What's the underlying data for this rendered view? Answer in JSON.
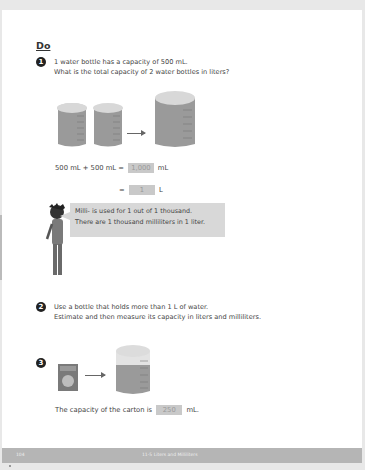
{
  "section_title": "Do",
  "questions": [
    {
      "number": "1",
      "lines": [
        "1 water bottle has a capacity of 500 mL.",
        "What is the total capacity of 2 water bottles in liters?"
      ],
      "equation1": {
        "left": "500 mL + 500 mL =",
        "answer": "1,000",
        "unit": "mL"
      },
      "equation2": {
        "left": "=",
        "answer": "1",
        "unit": "L"
      },
      "tip": [
        "Milli- is used for 1 out of 1 thousand.",
        "There are 1 thousand milliliters in 1 liter."
      ]
    },
    {
      "number": "2",
      "lines": [
        "Use a bottle that holds more than 1 L of water.",
        "Estimate and then measure its capacity in liters and milliliters."
      ]
    },
    {
      "number": "3",
      "sentence": {
        "left": "The capacity of the carton is",
        "answer": "250",
        "unit": "mL."
      }
    }
  ],
  "footer": {
    "page_number": "104",
    "chapter": "11-5  Liters and Milliliters"
  },
  "colors": {
    "answer_box": "#c9c9c9",
    "bubble": "#d8d8d8",
    "footer": "#b5b5b5"
  }
}
